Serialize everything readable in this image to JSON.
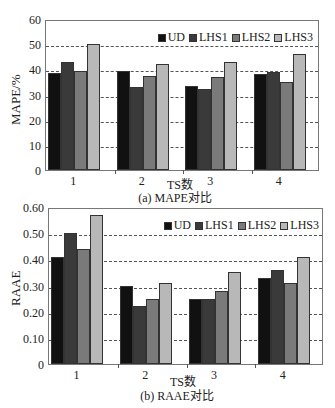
{
  "chart_data": [
    {
      "type": "bar",
      "title": "(a) MAPE对比",
      "xlabel": "TS数",
      "ylabel": "MAPE/%",
      "categories": [
        "1",
        "2",
        "3",
        "4"
      ],
      "ylim": [
        0,
        60
      ],
      "yticks": [
        "0",
        "10",
        "20",
        "30",
        "40",
        "50",
        "60"
      ],
      "grid": "dashed horizontal",
      "legend_position": "top-right inside",
      "series": [
        {
          "name": "UD",
          "color": "#111111",
          "values": [
            38.5,
            39.5,
            33.5,
            38
          ]
        },
        {
          "name": "LHS1",
          "color": "#3a3a3a",
          "values": [
            43,
            33,
            32,
            39
          ]
        },
        {
          "name": "LHS2",
          "color": "#7a7a7a",
          "values": [
            39.5,
            37.5,
            37,
            35
          ]
        },
        {
          "name": "LHS3",
          "color": "#b8b8b8",
          "values": [
            50,
            42,
            43,
            46
          ]
        }
      ]
    },
    {
      "type": "bar",
      "title": "(b) RAAE对比",
      "xlabel": "TS数",
      "ylabel": "RAAE",
      "categories": [
        "1",
        "2",
        "3",
        "4"
      ],
      "ylim": [
        0,
        0.6
      ],
      "yticks": [
        "0",
        "0.10",
        "0.20",
        "0.30",
        "0.40",
        "0.50",
        "0.60"
      ],
      "grid": "dashed horizontal",
      "legend_position": "top-right inside",
      "series": [
        {
          "name": "UD",
          "color": "#111111",
          "values": [
            0.41,
            0.3,
            0.25,
            0.33
          ]
        },
        {
          "name": "LHS1",
          "color": "#3a3a3a",
          "values": [
            0.5,
            0.22,
            0.25,
            0.36
          ]
        },
        {
          "name": "LHS2",
          "color": "#7a7a7a",
          "values": [
            0.44,
            0.25,
            0.28,
            0.31
          ]
        },
        {
          "name": "LHS3",
          "color": "#b8b8b8",
          "values": [
            0.57,
            0.31,
            0.35,
            0.41
          ]
        }
      ]
    }
  ],
  "charts": {
    "a": {
      "caption": "(a)  MAPE对比",
      "xlabel": "TS数",
      "ylabel": "MAPE/%"
    },
    "b": {
      "caption": "(b)  RAAE对比",
      "xlabel": "TS数",
      "ylabel": "RAAE"
    }
  }
}
